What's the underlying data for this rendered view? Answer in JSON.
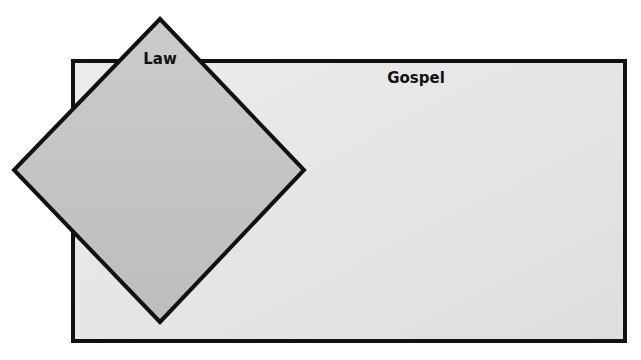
{
  "diagram": {
    "gospel": {
      "label": "Gospel",
      "fill": "#e6e6e6",
      "stroke": "#111111",
      "x": 73,
      "y": 61,
      "width": 552,
      "height": 280
    },
    "law": {
      "label": "Law",
      "fill": "#c4c4c4",
      "stroke": "#111111",
      "points": "160,19 304,170 160,322 14,170"
    }
  }
}
